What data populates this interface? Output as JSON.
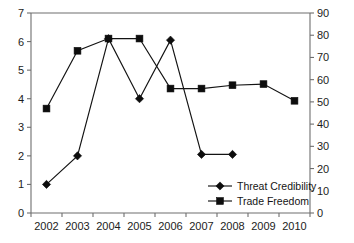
{
  "chart_data": {
    "type": "line",
    "title": "",
    "subtitle": "",
    "xlabel": "",
    "ylabel": "",
    "grid": false,
    "legend_position": "inside-bottom-right",
    "categories": [
      "2002",
      "2003",
      "2004",
      "2005",
      "2006",
      "2007",
      "2008",
      "2009",
      "2010"
    ],
    "axes": {
      "x": {
        "tick_labels": [
          "2002",
          "2003",
          "2004",
          "2005",
          "2006",
          "2007",
          "2008",
          "2009",
          "2010"
        ]
      },
      "y_left": {
        "label": "",
        "lim": [
          0,
          7
        ],
        "tick_labels": [
          "0",
          "1",
          "2",
          "3",
          "4",
          "5",
          "6",
          "7"
        ],
        "ticks": [
          0,
          1,
          2,
          3,
          4,
          5,
          6,
          7
        ]
      },
      "y_right": {
        "label": "",
        "lim": [
          0,
          90
        ],
        "tick_labels": [
          "0",
          "10",
          "20",
          "30",
          "40",
          "50",
          "60",
          "70",
          "80",
          "90"
        ],
        "ticks": [
          0,
          10,
          20,
          30,
          40,
          50,
          60,
          70,
          80,
          90
        ]
      }
    },
    "series": [
      {
        "name": "Threat Credibility",
        "marker": "diamond",
        "axis": "y_left",
        "color": "#0d0d0d",
        "x": [
          "2002",
          "2003",
          "2004",
          "2005",
          "2006",
          "2007",
          "2008"
        ],
        "values": [
          1.0,
          2.0,
          6.1,
          4.0,
          6.05,
          2.05,
          2.05
        ]
      },
      {
        "name": "Trade Freedom",
        "marker": "square",
        "axis": "y_right",
        "color": "#0d0d0d",
        "x": [
          "2002",
          "2003",
          "2004",
          "2005",
          "2006",
          "2007",
          "2008",
          "2009",
          "2010"
        ],
        "values": [
          47,
          73,
          78.5,
          78.5,
          56,
          56,
          57.5,
          58,
          50.5
        ]
      }
    ]
  },
  "legend": {
    "items": [
      {
        "label": "Threat Credibility",
        "marker": "diamond"
      },
      {
        "label": "Trade Freedom",
        "marker": "square"
      }
    ]
  }
}
